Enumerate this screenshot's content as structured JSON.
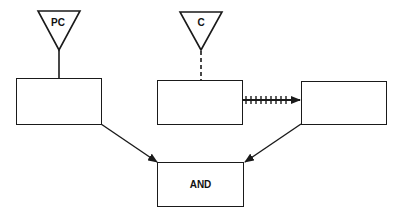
{
  "diagram": {
    "nodes": [
      {
        "id": "pc-trigger",
        "shape": "inverted-triangle",
        "label": "PC"
      },
      {
        "id": "c-trigger",
        "shape": "inverted-triangle",
        "label": "C"
      },
      {
        "id": "left-box",
        "shape": "rectangle",
        "label": ""
      },
      {
        "id": "middle-box",
        "shape": "rectangle",
        "label": ""
      },
      {
        "id": "right-box",
        "shape": "rectangle",
        "label": ""
      },
      {
        "id": "and-box",
        "shape": "rectangle",
        "label": "AND"
      }
    ],
    "edges": [
      {
        "from": "pc-trigger",
        "to": "left-box",
        "style": "solid"
      },
      {
        "from": "c-trigger",
        "to": "middle-box",
        "style": "dashed"
      },
      {
        "from": "middle-box",
        "to": "right-box",
        "style": "hatched-arrow"
      },
      {
        "from": "left-box",
        "to": "and-box",
        "style": "arrow"
      },
      {
        "from": "right-box",
        "to": "and-box",
        "style": "arrow"
      }
    ],
    "colors": {
      "stroke": "#1a1a1a",
      "background": "#ffffff"
    }
  }
}
